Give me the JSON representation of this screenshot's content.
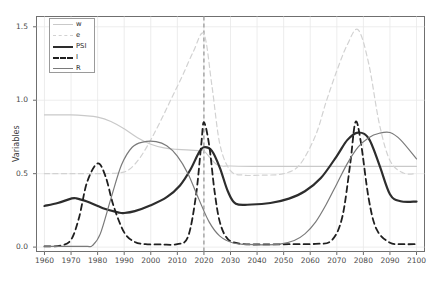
{
  "chart_data": {
    "type": "line",
    "title": "",
    "xlabel": "",
    "ylabel": "Variables",
    "xlim": [
      1957,
      2103
    ],
    "ylim": [
      -0.03,
      1.57
    ],
    "xticks": [
      1960,
      1970,
      1980,
      1990,
      2000,
      2010,
      2020,
      2030,
      2040,
      2050,
      2060,
      2070,
      2080,
      2090,
      2100
    ],
    "yticks": [
      0.0,
      0.5,
      1.0,
      1.5
    ],
    "ytick_labels": [
      "0.0",
      "0.5",
      "1.0",
      "1.5"
    ],
    "grid": true,
    "legend_position": "upper left",
    "annotations": [
      {
        "type": "vline",
        "x": 2020,
        "style": "dashed",
        "color": "#8a8a8a"
      }
    ],
    "series": [
      {
        "name": "w",
        "style": "solid",
        "color": "#c9c9c9",
        "width": 1.2,
        "x": [
          1960,
          1965,
          1970,
          1975,
          1980,
          1985,
          1990,
          1995,
          2000,
          2005,
          2010,
          2015,
          2018,
          2020,
          2025,
          2030,
          2040,
          2050,
          2060,
          2070,
          2080,
          2090,
          2100
        ],
        "values": [
          0.9,
          0.9,
          0.9,
          0.895,
          0.885,
          0.855,
          0.805,
          0.745,
          0.7,
          0.675,
          0.665,
          0.66,
          0.657,
          0.655,
          0.56,
          0.552,
          0.55,
          0.55,
          0.55,
          0.55,
          0.55,
          0.55,
          0.55
        ]
      },
      {
        "name": "e",
        "style": "dashed",
        "color": "#d2d2d2",
        "width": 1.2,
        "x": [
          1960,
          1970,
          1980,
          1988,
          1992,
          1996,
          2000,
          2004,
          2008,
          2012,
          2016,
          2020,
          2023,
          2026,
          2030,
          2035,
          2042,
          2050,
          2056,
          2062,
          2066,
          2070,
          2074,
          2078,
          2082,
          2086,
          2090,
          2095,
          2100
        ],
        "values": [
          0.5,
          0.5,
          0.5,
          0.505,
          0.53,
          0.61,
          0.73,
          0.87,
          1.02,
          1.17,
          1.33,
          1.45,
          1.1,
          0.7,
          0.52,
          0.49,
          0.49,
          0.5,
          0.56,
          0.76,
          0.99,
          1.2,
          1.38,
          1.48,
          1.25,
          0.84,
          0.59,
          0.505,
          0.5
        ]
      },
      {
        "name": "PSI",
        "style": "solid",
        "color": "#2d2d2d",
        "width": 2.2,
        "x": [
          1960,
          1965,
          1970,
          1972,
          1976,
          1982,
          1988,
          1990,
          1994,
          2000,
          2006,
          2011,
          2015,
          2018,
          2020,
          2023,
          2026,
          2029,
          2032,
          2038,
          2045,
          2052,
          2058,
          2064,
          2070,
          2074,
          2078,
          2082,
          2086,
          2090,
          2094,
          2100
        ],
        "values": [
          0.28,
          0.3,
          0.33,
          0.332,
          0.31,
          0.265,
          0.235,
          0.232,
          0.245,
          0.285,
          0.34,
          0.42,
          0.53,
          0.64,
          0.68,
          0.655,
          0.54,
          0.38,
          0.295,
          0.29,
          0.3,
          0.33,
          0.38,
          0.47,
          0.62,
          0.73,
          0.78,
          0.74,
          0.56,
          0.36,
          0.312,
          0.31
        ]
      },
      {
        "name": "I",
        "style": "dashed",
        "color": "#1f1f1f",
        "width": 1.8,
        "x": [
          1960,
          1966,
          1970,
          1973,
          1976,
          1980,
          1983,
          1986,
          1990,
          1994,
          1998,
          2004,
          2010,
          2014,
          2017,
          2019,
          2020,
          2022,
          2024,
          2026,
          2029,
          2034,
          2042,
          2052,
          2062,
          2068,
          2072,
          2075,
          2077,
          2079,
          2082,
          2085,
          2090,
          2095,
          2100
        ],
        "values": [
          0.005,
          0.01,
          0.05,
          0.2,
          0.44,
          0.57,
          0.48,
          0.28,
          0.1,
          0.035,
          0.02,
          0.018,
          0.02,
          0.07,
          0.35,
          0.7,
          0.85,
          0.69,
          0.38,
          0.17,
          0.055,
          0.022,
          0.018,
          0.02,
          0.022,
          0.045,
          0.2,
          0.56,
          0.85,
          0.72,
          0.33,
          0.12,
          0.03,
          0.02,
          0.02
        ]
      },
      {
        "name": "R",
        "style": "solid",
        "color": "#7a7a7a",
        "width": 1.2,
        "x": [
          1960,
          1970,
          1976,
          1978,
          1981,
          1985,
          1989,
          1993,
          1997,
          2002,
          2006,
          2010,
          2014,
          2018,
          2022,
          2026,
          2031,
          2036,
          2042,
          2048,
          2054,
          2058,
          2062,
          2066,
          2070,
          2074,
          2078,
          2082,
          2086,
          2090,
          2094,
          2100
        ],
        "values": [
          0.005,
          0.005,
          0.005,
          0.01,
          0.09,
          0.33,
          0.56,
          0.68,
          0.715,
          0.718,
          0.69,
          0.62,
          0.5,
          0.33,
          0.17,
          0.075,
          0.028,
          0.018,
          0.015,
          0.018,
          0.045,
          0.09,
          0.17,
          0.29,
          0.43,
          0.57,
          0.68,
          0.745,
          0.775,
          0.78,
          0.73,
          0.6
        ]
      }
    ]
  },
  "legend": {
    "entries": [
      {
        "label": "w"
      },
      {
        "label": "e"
      },
      {
        "label": "PSI"
      },
      {
        "label": "I"
      },
      {
        "label": "R"
      }
    ]
  }
}
